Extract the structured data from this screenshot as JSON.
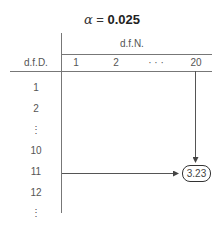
{
  "title": {
    "symbol": "α",
    "equals": " = ",
    "value": "0.025"
  },
  "header": {
    "column_group_label": "d.f.N.",
    "row_group_label": "d.f.D.",
    "columns": [
      "1",
      "2",
      "· · ·",
      "20"
    ]
  },
  "rows": [
    "1",
    "2",
    "⋮",
    "10",
    "11",
    "12",
    "⋮"
  ],
  "highlight": {
    "row": "11",
    "column": "20",
    "value": "3.23"
  },
  "colors": {
    "line": "#777777",
    "text": "#555555",
    "arrow": "#444444"
  }
}
